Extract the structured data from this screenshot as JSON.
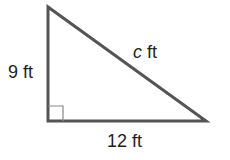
{
  "diagram": {
    "type": "right-triangle",
    "vertices": {
      "top": [
        48,
        7
      ],
      "right_angle": [
        48,
        121
      ],
      "right": [
        206,
        121
      ]
    },
    "labels": {
      "vertical_leg": "9 ft",
      "hypotenuse_var": "c",
      "hypotenuse_unit": " ft",
      "horizontal_leg": "12 ft"
    },
    "colors": {
      "stroke": "#555555",
      "text": "#231f20",
      "right_angle_marker": "#888888"
    }
  }
}
